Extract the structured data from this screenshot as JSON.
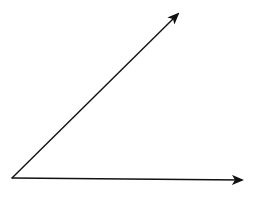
{
  "diagram": {
    "type": "angle",
    "description": "Two rays sharing a common vertex forming an acute angle",
    "colors": {
      "background": "#ffffff",
      "stroke": "#111111"
    },
    "vertex": {
      "x": 12,
      "y": 178
    },
    "rays": [
      {
        "name": "upper-ray",
        "from": {
          "x": 12,
          "y": 178
        },
        "to": {
          "x": 178,
          "y": 14
        }
      },
      {
        "name": "horizontal-ray",
        "from": {
          "x": 12,
          "y": 178
        },
        "to": {
          "x": 242,
          "y": 180
        }
      }
    ]
  }
}
